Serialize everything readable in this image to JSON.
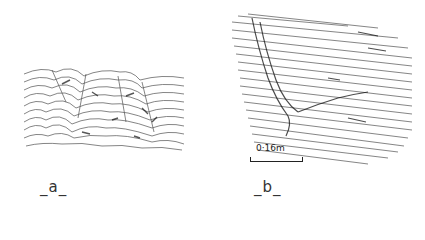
{
  "figure": {
    "panels": [
      {
        "id": "a",
        "label": "_a_",
        "description": "hatched line drawing of a folded/crumpled band texture"
      },
      {
        "id": "b",
        "label": "_b_",
        "description": "hatched line drawing of a sloped surface with a diagonal ridge"
      }
    ],
    "scale_bar": {
      "label": "0·16m"
    },
    "colors": {
      "ink": "#222222",
      "background": "#ffffff"
    }
  }
}
